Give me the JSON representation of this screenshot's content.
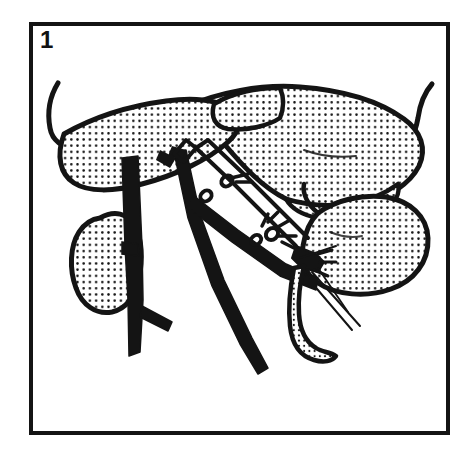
{
  "figure": {
    "number_label": "1",
    "caption": "",
    "domain": "medical-surgical-line-illustration",
    "background_color": "#ffffff",
    "ink_color": "#111111",
    "stipple_color": "#111111",
    "frame": {
      "name": "panel-border",
      "x": 31,
      "y": 24,
      "width": 417,
      "height": 409,
      "stroke_width": 4,
      "color": "#111111",
      "fill": "#ffffff"
    },
    "structures": [
      {
        "id": "liver",
        "label": "liver",
        "fill": "stipple",
        "outline": "#111111",
        "position": "upper-center-spanning-left-to-right"
      },
      {
        "id": "liver-left-lobe",
        "label": "left hepatic lobe",
        "fill": "stipple",
        "outline": "#111111",
        "position": "upper-left"
      },
      {
        "id": "liver-caudate-lobe",
        "label": "caudate lobe outline",
        "fill": "stipple",
        "outline": "#111111",
        "position": "top-center"
      },
      {
        "id": "kidney",
        "label": "kidney",
        "fill": "stipple",
        "outline": "#111111",
        "position": "left-middle"
      },
      {
        "id": "spleen",
        "label": "spleen",
        "fill": "stipple",
        "outline": "#111111",
        "position": "right-middle"
      },
      {
        "id": "pancreas-tail",
        "label": "pancreatic tail / duct",
        "fill": "stipple",
        "outline": "#111111",
        "position": "lower-right-curved-tube"
      },
      {
        "id": "vena-cava",
        "label": "inferior vena cava",
        "fill": "solid-black",
        "position": "left-vertical-trunk"
      },
      {
        "id": "aorta",
        "label": "aorta",
        "fill": "solid-black",
        "position": "center-vertical-trunk"
      },
      {
        "id": "renal-vein",
        "label": "renal vein branch",
        "fill": "solid-black",
        "position": "left-horizontal-branch-to-kidney"
      },
      {
        "id": "splenic-artery",
        "label": "splenic artery",
        "fill": "solid-black",
        "position": "center-diagonal-to-spleen-hilum"
      },
      {
        "id": "ligated-vessel",
        "label": "ligated vessel with sutures",
        "fill": "outline",
        "position": "center-diagonal"
      },
      {
        "id": "retractor-left",
        "label": "retractor hook (left)",
        "fill": "outline",
        "position": "upper-left-edge"
      },
      {
        "id": "retractor-right",
        "label": "retractor hook (right)",
        "fill": "outline",
        "position": "upper-right-edge"
      },
      {
        "id": "suture-threads",
        "label": "suture threads",
        "fill": "thin-lines",
        "position": "lower-right"
      }
    ],
    "ligatures": [
      {
        "id": "ligature-upper",
        "label": "upper ligature knot",
        "x": 228,
        "y": 185
      },
      {
        "id": "ligature-lower",
        "label": "lower ligature knot",
        "x": 268,
        "y": 232
      }
    ]
  }
}
